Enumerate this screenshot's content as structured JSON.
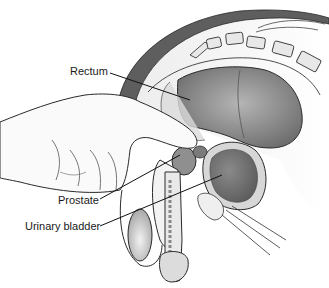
{
  "figure": {
    "labels": [
      {
        "id": "rectum",
        "text": "Rectum"
      },
      {
        "id": "prostate",
        "text": "Prostate"
      },
      {
        "id": "bladder",
        "text": "Urinary bladder"
      }
    ]
  },
  "colors": {
    "outline": "#2a2a2a",
    "dark_band": "#555555",
    "tissue_light": "#e6e6e6",
    "tissue_mid": "#9a9a9a",
    "tissue_dark": "#6e6e6e",
    "hand": "#f7f7f7"
  }
}
